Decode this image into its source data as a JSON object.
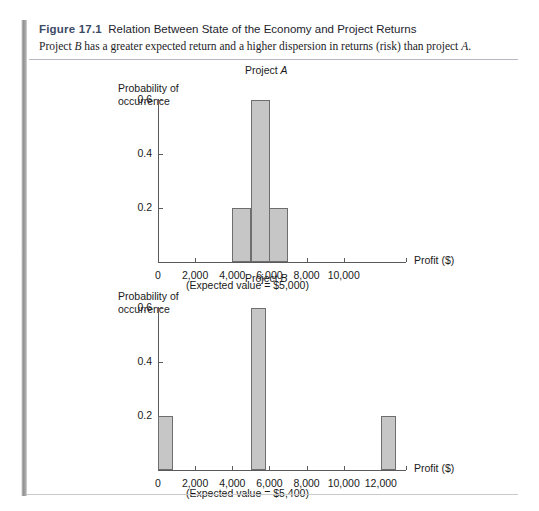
{
  "figure": {
    "label": "Figure 17.1",
    "title": "Relation Between State of the Economy and Project Returns",
    "subtitle_pre": "Project ",
    "subtitle_italic1": "B",
    "subtitle_mid": " has a greater expected return and a higher dispersion in returns (risk) than project ",
    "subtitle_italic2": "A",
    "subtitle_end": ".",
    "accent_color": "#8e8e8e",
    "rule_color": "#b9b9c6"
  },
  "chart_data": [
    {
      "id": "project-a",
      "type": "bar",
      "title_pre": "Project ",
      "title_italic": "A",
      "ylabel_line1": "Probability of",
      "ylabel_line2": "occurrence",
      "xlabel": "Profit ($)",
      "note": "(Expected value = $5,000)",
      "categories": [
        4500,
        5500,
        6500
      ],
      "values": [
        0.2,
        0.6,
        0.2
      ],
      "bar_x_left": [
        4000,
        5000,
        6000
      ],
      "bar_x_right": [
        5000,
        6000,
        7000
      ],
      "xticks": [
        0,
        2000,
        4000,
        6000,
        8000,
        10000
      ],
      "xtick_labels": [
        "0",
        "2,000",
        "4,000",
        "6,000",
        "8,000",
        "10,000"
      ],
      "yticks": [
        0.2,
        0.4,
        0.6
      ],
      "ytick_labels": [
        "0.2",
        "0.4",
        "0.6"
      ],
      "xlim": [
        0,
        14000
      ],
      "ylim": [
        0,
        0.66
      ],
      "bar_fill": "#c6c6c6",
      "bar_stroke": "#6e6e6e",
      "grid": false,
      "legend": "none"
    },
    {
      "id": "project-b",
      "type": "bar",
      "title_pre": "Project ",
      "title_italic": "B",
      "ylabel_line1": "Probability of",
      "ylabel_line2": "occurrence",
      "xlabel": "Profit ($)",
      "note": "(Expected value = $5,400)",
      "categories": [
        400,
        5400,
        12400
      ],
      "values": [
        0.2,
        0.6,
        0.2
      ],
      "bar_x_left": [
        0,
        5000,
        12000
      ],
      "bar_x_right": [
        800,
        5800,
        12800
      ],
      "xticks": [
        0,
        2000,
        4000,
        6000,
        8000,
        10000,
        12000
      ],
      "xtick_labels": [
        "0",
        "2,000",
        "4,000",
        "6,000",
        "8,000",
        "10,000",
        "12,000"
      ],
      "yticks": [
        0.2,
        0.4,
        0.6
      ],
      "ytick_labels": [
        "0.2",
        "0.4",
        "0.6"
      ],
      "xlim": [
        0,
        14000
      ],
      "ylim": [
        0,
        0.66
      ],
      "bar_fill": "#c6c6c6",
      "bar_stroke": "#6e6e6e",
      "grid": false,
      "legend": "none"
    }
  ]
}
